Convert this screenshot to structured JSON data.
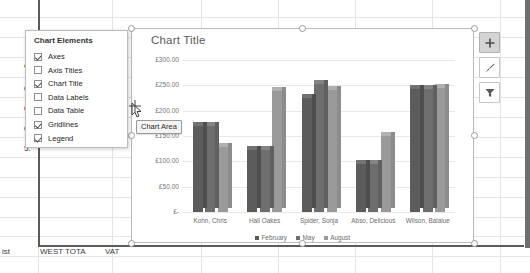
{
  "app": {
    "context": "excel-chart-editing"
  },
  "spreadsheet": {
    "visible_cells": [
      {
        "text": "0.14",
        "x": 203,
        "y": 231
      },
      {
        "text": "ist",
        "x": 2,
        "y": 247
      },
      {
        "text": "WEST TOTA",
        "x": 40,
        "y": 247
      },
      {
        "text": "VAT",
        "x": 105,
        "y": 247
      },
      {
        "text": "es",
        "x": 24,
        "y": 61
      },
      {
        "text": "0.",
        "x": 24,
        "y": 84
      },
      {
        "text": "0.",
        "x": 24,
        "y": 104
      },
      {
        "text": "0.",
        "x": 24,
        "y": 124
      },
      {
        "text": "5.",
        "x": 24,
        "y": 144
      },
      {
        "text": "14",
        "x": 119,
        "y": 52
      }
    ]
  },
  "flyout": {
    "title": "Chart Elements",
    "items": [
      {
        "label": "Axes",
        "checked": true
      },
      {
        "label": "Axis Titles",
        "checked": false
      },
      {
        "label": "Chart Title",
        "checked": true
      },
      {
        "label": "Data Labels",
        "checked": false
      },
      {
        "label": "Data Table",
        "checked": false
      },
      {
        "label": "Gridlines",
        "checked": true
      },
      {
        "label": "Legend",
        "checked": true
      }
    ]
  },
  "tooltip": {
    "text": "Chart Area"
  },
  "side_buttons": [
    {
      "name": "chart-elements-button",
      "icon": "plus-icon",
      "active": true
    },
    {
      "name": "chart-styles-button",
      "icon": "brush-icon",
      "active": false
    },
    {
      "name": "chart-filters-button",
      "icon": "funnel-icon",
      "active": false
    }
  ],
  "chart_data": {
    "type": "bar",
    "title": "Chart Title",
    "xlabel": "",
    "ylabel": "",
    "grid": true,
    "legend_position": "bottom",
    "ylim": [
      0,
      300
    ],
    "ytick_labels": [
      "£300.00",
      "£250.00",
      "£200.00",
      "£150.00",
      "£100.00",
      "£50.00",
      "£-"
    ],
    "ytick_values": [
      300,
      250,
      200,
      150,
      100,
      50,
      0
    ],
    "categories": [
      "Kohn, Chris",
      "Hall Oakes",
      "Spider, Sonja",
      "Abso, Delicious",
      "Wilson, Balalue"
    ],
    "series": [
      {
        "name": "February",
        "color": "#5c5c5c",
        "values": [
          170,
          122,
          225,
          95,
          243
        ]
      },
      {
        "name": "May",
        "color": "#6e6e6e",
        "values": [
          170,
          122,
          253,
          95,
          243
        ]
      },
      {
        "name": "August",
        "color": "#9a9a9a",
        "values": [
          128,
          238,
          240,
          150,
          245
        ]
      }
    ]
  },
  "colors": {
    "series_1": "#5c5c5c",
    "series_2": "#6e6e6e",
    "series_3": "#9a9a9a",
    "gridline": "#e8e8e8",
    "axis_text": "#777777",
    "title_text": "#595959",
    "selection": "#b9b9b9"
  }
}
